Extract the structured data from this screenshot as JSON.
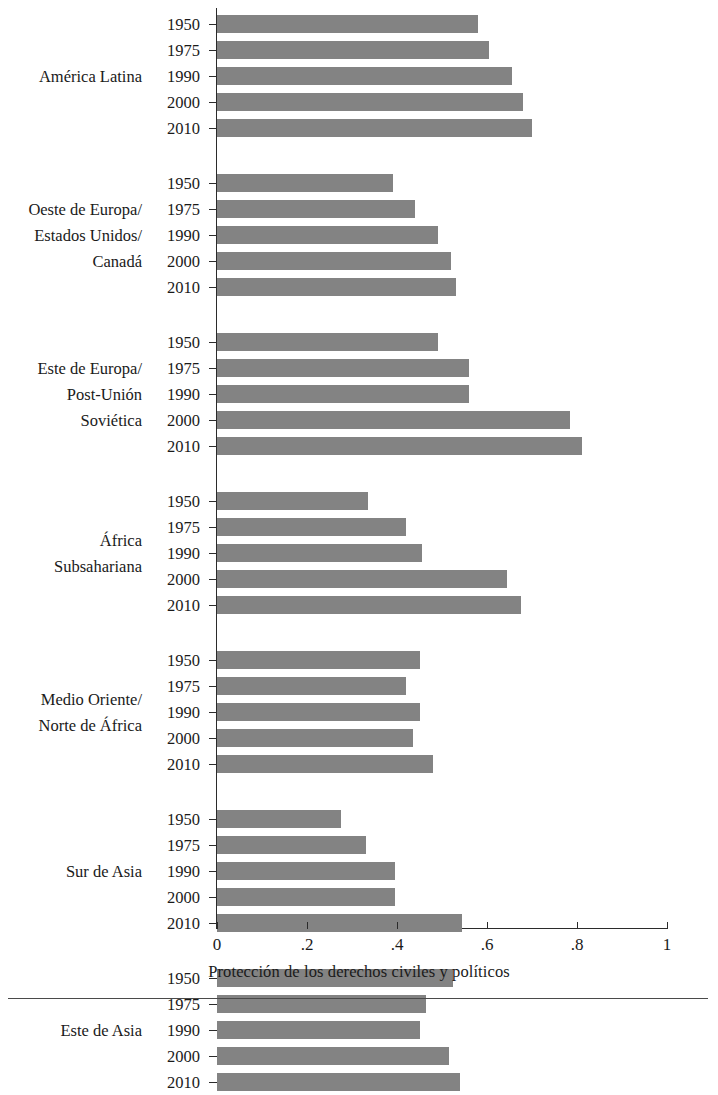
{
  "chart_data": {
    "type": "bar",
    "orientation": "horizontal",
    "title": "",
    "subtitle": "",
    "xlabel": "Protección de los derechos civiles y políticos",
    "ylabel": "",
    "xlim": [
      0,
      1
    ],
    "xticks": [
      0,
      0.2,
      0.4,
      0.6,
      0.8,
      1
    ],
    "xtick_labels": [
      "0",
      ".2",
      ".4",
      ".6",
      ".8",
      "1"
    ],
    "grid": false,
    "legend": null,
    "bar_color": "#838383",
    "categories": [
      "1950",
      "1975",
      "1990",
      "2000",
      "2010"
    ],
    "groups": [
      {
        "label": "América Latina",
        "years": [
          "1950",
          "1975",
          "1990",
          "2000",
          "2010"
        ],
        "values": [
          0.58,
          0.605,
          0.655,
          0.68,
          0.7
        ]
      },
      {
        "label": "Oeste de Europa/\nEstados Unidos/\nCanadá",
        "years": [
          "1950",
          "1975",
          "1990",
          "2000",
          "2010"
        ],
        "values": [
          0.39,
          0.44,
          0.49,
          0.52,
          0.53
        ]
      },
      {
        "label": "Este de Europa/\nPost-Unión\nSoviética",
        "years": [
          "1950",
          "1975",
          "1990",
          "2000",
          "2010"
        ],
        "values": [
          0.49,
          0.56,
          0.56,
          0.785,
          0.81
        ]
      },
      {
        "label": "África\nSubsahariana",
        "years": [
          "1950",
          "1975",
          "1990",
          "2000",
          "2010"
        ],
        "values": [
          0.335,
          0.42,
          0.455,
          0.645,
          0.675
        ]
      },
      {
        "label": "Medio Oriente/\nNorte de África",
        "years": [
          "1950",
          "1975",
          "1990",
          "2000",
          "2010"
        ],
        "values": [
          0.45,
          0.42,
          0.45,
          0.435,
          0.48
        ]
      },
      {
        "label": "Sur de Asia",
        "years": [
          "1950",
          "1975",
          "1990",
          "2000",
          "2010"
        ],
        "values": [
          0.275,
          0.33,
          0.395,
          0.395,
          0.545
        ]
      },
      {
        "label": "Este de Asia",
        "years": [
          "1950",
          "1975",
          "1990",
          "2000",
          "2010"
        ],
        "values": [
          0.525,
          0.465,
          0.45,
          0.515,
          0.54
        ]
      }
    ]
  }
}
